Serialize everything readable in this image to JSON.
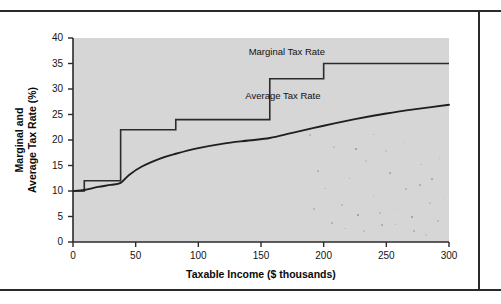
{
  "figure": {
    "background_color": "#ffffff",
    "plot_background_color": "#d6d6d6",
    "line_color": "#2b2b2b"
  },
  "chart_data": {
    "type": "line",
    "title": "",
    "xlabel": "Taxable Income ($ thousands)",
    "ylabel": "Marginal and Average Tax Rate (%)",
    "xlim": [
      0,
      300
    ],
    "ylim": [
      0,
      40
    ],
    "xticks": [
      0,
      50,
      100,
      150,
      200,
      250,
      300
    ],
    "yticks": [
      0,
      5,
      10,
      15,
      20,
      25,
      30,
      35,
      40
    ],
    "grid": false,
    "legend": "inline-annotations",
    "series": [
      {
        "name": "Marginal Tax Rate",
        "style": "step",
        "label_x": 200,
        "label_y": 37,
        "brackets": [
          {
            "x_start": 0,
            "x_end": 9,
            "rate": 10
          },
          {
            "x_start": 9,
            "x_end": 38,
            "rate": 12
          },
          {
            "x_start": 38,
            "x_end": 82,
            "rate": 22
          },
          {
            "x_start": 82,
            "x_end": 157,
            "rate": 24
          },
          {
            "x_start": 157,
            "x_end": 200,
            "rate": 32
          },
          {
            "x_start": 200,
            "x_end": 300,
            "rate": 35
          }
        ]
      },
      {
        "name": "Average Tax Rate",
        "style": "curve",
        "label_x": 175,
        "label_y": 28.5,
        "x": [
          0,
          9,
          20,
          30,
          38,
          45,
          55,
          70,
          82,
          100,
          120,
          140,
          157,
          175,
          200,
          225,
          250,
          275,
          300
        ],
        "y": [
          10,
          10.2,
          10.8,
          11.2,
          11.6,
          13.2,
          14.8,
          16.4,
          17.3,
          18.4,
          19.3,
          19.9,
          20.4,
          21.4,
          22.8,
          24.1,
          25.2,
          26.1,
          26.9
        ]
      }
    ]
  },
  "axis": {
    "y_label_line1": "Marginal and",
    "y_label_line2": "Average Tax Rate (%)"
  }
}
